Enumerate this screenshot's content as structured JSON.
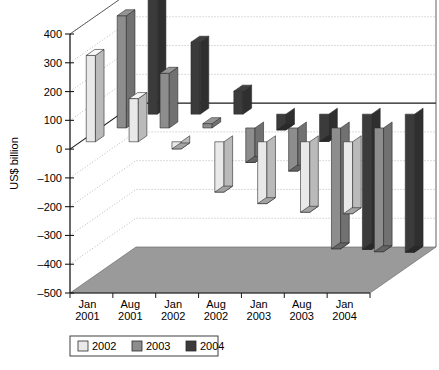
{
  "chart_data": {
    "type": "bar",
    "title": "",
    "xlabel": "",
    "ylabel": "US$ billion",
    "ylim": [
      -500,
      400
    ],
    "ytick_step": 100,
    "yticks": [
      "400",
      "300",
      "200",
      "100",
      "0",
      "-100",
      "-200",
      "-300",
      "-400",
      "-500"
    ],
    "categories": [
      "Jan 2001",
      "Aug 2001",
      "Jan 2002",
      "Aug 2002",
      "Jan 2003",
      "Aug 2003",
      "Jan 2004"
    ],
    "category_lines": [
      [
        "Jan",
        "2001"
      ],
      [
        "Aug",
        "2001"
      ],
      [
        "Jan",
        "2002"
      ],
      [
        "Aug",
        "2002"
      ],
      [
        "Jan",
        "2003"
      ],
      [
        "Aug",
        "2003"
      ],
      [
        "Jan",
        "2004"
      ]
    ],
    "series": [
      {
        "name": "2002",
        "color": "#e9e9e9",
        "values": [
          300,
          150,
          -25,
          -175,
          -215,
          -245,
          -250
        ]
      },
      {
        "name": "2003",
        "color": "#8d8d8d",
        "values": [
          390,
          190,
          15,
          -120,
          -150,
          -420,
          -430
        ]
      },
      {
        "name": "2004",
        "color": "#3b3b3b",
        "values": [
          430,
          250,
          80,
          -55,
          -95,
          -470,
          -480
        ]
      }
    ],
    "legend": {
      "position": "bottom",
      "entries": [
        {
          "label": "2002",
          "color": "#e9e9e9"
        },
        {
          "label": "2003",
          "color": "#8d8d8d"
        },
        {
          "label": "2004",
          "color": "#3b3b3b"
        }
      ]
    },
    "grid": true,
    "projection": "3d",
    "floor_color": "#9a9a9a",
    "grid_color": "#9b9b9b",
    "axis_color": "#1a1a1a"
  }
}
